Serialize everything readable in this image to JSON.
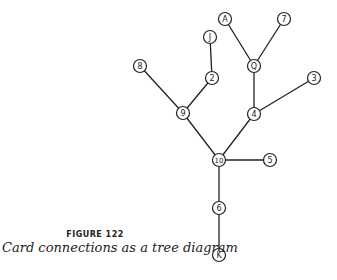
{
  "figure": {
    "number_label": "FIGURE 122",
    "caption": "Card connections as a tree diagram"
  },
  "diagram": {
    "type": "tree",
    "nodes": [
      {
        "id": "A",
        "label": "A",
        "x": 225,
        "y": 19
      },
      {
        "id": "7",
        "label": "7",
        "x": 284,
        "y": 19
      },
      {
        "id": "J",
        "label": "J",
        "x": 210,
        "y": 37
      },
      {
        "id": "Q",
        "label": "Q",
        "x": 254,
        "y": 66
      },
      {
        "id": "8",
        "label": "8",
        "x": 140,
        "y": 66
      },
      {
        "id": "2",
        "label": "2",
        "x": 212,
        "y": 78
      },
      {
        "id": "3",
        "label": "3",
        "x": 314,
        "y": 78
      },
      {
        "id": "9",
        "label": "9",
        "x": 183,
        "y": 113
      },
      {
        "id": "4",
        "label": "4",
        "x": 254,
        "y": 114
      },
      {
        "id": "10",
        "label": "10",
        "x": 219,
        "y": 160
      },
      {
        "id": "5",
        "label": "5",
        "x": 270,
        "y": 160
      },
      {
        "id": "6",
        "label": "6",
        "x": 219,
        "y": 208
      },
      {
        "id": "K",
        "label": "K",
        "x": 219,
        "y": 255
      }
    ],
    "edges": [
      [
        "A",
        "Q"
      ],
      [
        "7",
        "Q"
      ],
      [
        "Q",
        "4"
      ],
      [
        "3",
        "4"
      ],
      [
        "4",
        "10"
      ],
      [
        "J",
        "2"
      ],
      [
        "2",
        "9"
      ],
      [
        "8",
        "9"
      ],
      [
        "9",
        "10"
      ],
      [
        "10",
        "5"
      ],
      [
        "10",
        "6"
      ],
      [
        "6",
        "K"
      ]
    ],
    "colors": {
      "stroke": "#222222",
      "fill": "#ffffff",
      "text": "#222222"
    }
  }
}
